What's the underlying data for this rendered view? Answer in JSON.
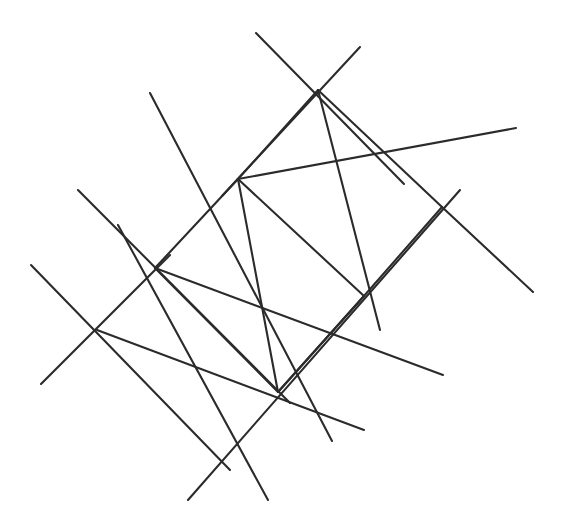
{
  "figure": {
    "background_color": "#ffffff",
    "stroke_color": "#2b2b2b",
    "stroke_width": 2.1,
    "canvas": {
      "width": 563,
      "height": 530
    },
    "nodes": [
      {
        "name": "node-top",
        "x": 318,
        "y": 90
      },
      {
        "name": "node-upper-left",
        "x": 238,
        "y": 179
      },
      {
        "name": "node-right",
        "x": 442,
        "y": 207
      },
      {
        "name": "node-left",
        "x": 155,
        "y": 268
      },
      {
        "name": "node-center-right",
        "x": 364,
        "y": 296
      },
      {
        "name": "node-far-left",
        "x": 97,
        "y": 330
      },
      {
        "name": "node-bottom",
        "x": 278,
        "y": 392
      },
      {
        "name": "node-bottom-left",
        "x": 222,
        "y": 458
      }
    ],
    "segments": [
      {
        "name": "segment-top-left-diagonal",
        "x1": 256,
        "y1": 33,
        "x2": 404,
        "y2": 184
      },
      {
        "name": "segment-top-right-diagonal",
        "x1": 360,
        "y1": 47,
        "x2": 222,
        "y2": 196
      },
      {
        "name": "segment-top-to-center-right",
        "x1": 318,
        "y1": 90,
        "x2": 380,
        "y2": 330
      },
      {
        "name": "segment-upper-left-long-diagonal",
        "x1": 150,
        "y1": 93,
        "x2": 332,
        "y2": 441
      },
      {
        "name": "segment-upper-left-to-right-rail",
        "x1": 238,
        "y1": 179,
        "x2": 516,
        "y2": 128
      },
      {
        "name": "segment-right-down-diagonal",
        "x1": 442,
        "y1": 207,
        "x2": 533,
        "y2": 292
      },
      {
        "name": "segment-right-to-bottom-left-rail",
        "x1": 460,
        "y1": 190,
        "x2": 188,
        "y2": 500
      },
      {
        "name": "segment-far-left-upper-diagonal",
        "x1": 78,
        "y1": 190,
        "x2": 290,
        "y2": 403
      },
      {
        "name": "segment-left-to-center-right-rail",
        "x1": 155,
        "y1": 268,
        "x2": 443,
        "y2": 375
      },
      {
        "name": "segment-left-node-long-diagonal",
        "x1": 118,
        "y1": 225,
        "x2": 268,
        "y2": 500
      },
      {
        "name": "segment-far-left-cross-a",
        "x1": 31,
        "y1": 265,
        "x2": 230,
        "y2": 470
      },
      {
        "name": "segment-far-left-cross-b",
        "x1": 41,
        "y1": 384,
        "x2": 170,
        "y2": 255
      },
      {
        "name": "segment-far-left-to-bottom-rail",
        "x1": 97,
        "y1": 330,
        "x2": 364,
        "y2": 430
      },
      {
        "name": "segment-left-to-upper-left-edge",
        "x1": 155,
        "y1": 268,
        "x2": 238,
        "y2": 179
      },
      {
        "name": "segment-upper-left-to-bottom-edge",
        "x1": 238,
        "y1": 179,
        "x2": 278,
        "y2": 392
      },
      {
        "name": "segment-upper-left-to-center-right-edge",
        "x1": 238,
        "y1": 179,
        "x2": 364,
        "y2": 296
      },
      {
        "name": "segment-left-to-bottom-edge",
        "x1": 155,
        "y1": 268,
        "x2": 278,
        "y2": 392
      },
      {
        "name": "segment-bottom-to-center-right-edge",
        "x1": 278,
        "y1": 392,
        "x2": 364,
        "y2": 296
      },
      {
        "name": "segment-top-to-upper-left-edge",
        "x1": 318,
        "y1": 90,
        "x2": 238,
        "y2": 179
      },
      {
        "name": "segment-top-to-right-edge",
        "x1": 318,
        "y1": 90,
        "x2": 442,
        "y2": 207
      },
      {
        "name": "segment-right-to-center-right-edge",
        "x1": 442,
        "y1": 207,
        "x2": 364,
        "y2": 296
      },
      {
        "name": "segment-center-right-to-bottom-ext",
        "x1": 364,
        "y1": 296,
        "x2": 278,
        "y2": 392
      }
    ]
  }
}
